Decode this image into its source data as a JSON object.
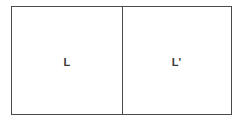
{
  "diagram": {
    "type": "two-cell-rectangle-pair",
    "background_color": "#ffffff",
    "border_color": "#4a4a4a",
    "label_color": "#3a3a3a",
    "cells": [
      {
        "id": "left",
        "label": "L",
        "name": "cell-left"
      },
      {
        "id": "right",
        "label": "L'",
        "name": "cell-right"
      }
    ]
  }
}
